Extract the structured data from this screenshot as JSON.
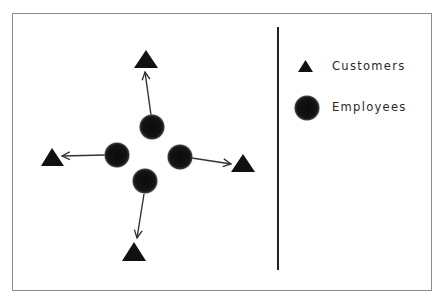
{
  "diagram": {
    "type": "hub-and-spoke",
    "colors": {
      "frame_border": "#8a8a8a",
      "shape_fill": "#111111",
      "arrow": "#333333",
      "divider": "#222222",
      "text": "#2a2a2a"
    },
    "employees": [
      {
        "id": "employee-top",
        "cx": 152,
        "cy": 127,
        "r": 13
      },
      {
        "id": "employee-left",
        "cx": 117,
        "cy": 155,
        "r": 13
      },
      {
        "id": "employee-right",
        "cx": 180,
        "cy": 157,
        "r": 13
      },
      {
        "id": "employee-bottom",
        "cx": 145,
        "cy": 181,
        "r": 13
      }
    ],
    "customers": [
      {
        "id": "customer-top",
        "points": "146,50 134,68 158,68"
      },
      {
        "id": "customer-left",
        "points": "52,148 41,166 64,166"
      },
      {
        "id": "customer-right",
        "points": "243,154 231,172 255,172"
      },
      {
        "id": "customer-bottom",
        "points": "134,242 122,261 146,261"
      }
    ],
    "arrows": [
      {
        "from": "employee-top",
        "to": "customer-top",
        "x1": 151,
        "y1": 115,
        "x2": 145,
        "y2": 72
      },
      {
        "from": "employee-left",
        "to": "customer-left",
        "x1": 105,
        "y1": 155,
        "x2": 62,
        "y2": 156
      },
      {
        "from": "employee-right",
        "to": "customer-right",
        "x1": 192,
        "y1": 158,
        "x2": 231,
        "y2": 164
      },
      {
        "from": "employee-bottom",
        "to": "customer-bottom",
        "x1": 144,
        "y1": 194,
        "x2": 137,
        "y2": 238
      }
    ]
  },
  "legend": {
    "items": [
      {
        "shape": "triangle",
        "label": "Customers"
      },
      {
        "shape": "circle",
        "label": "Employees"
      }
    ]
  }
}
